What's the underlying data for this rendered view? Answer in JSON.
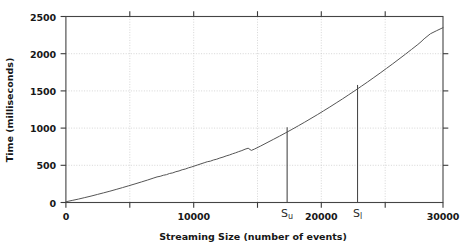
{
  "chart_data": {
    "type": "line",
    "title": "",
    "xlabel": "Streaming Size (number of events)",
    "ylabel": "Time (milliseconds)",
    "xlim": [
      0,
      30000
    ],
    "ylim": [
      0,
      2500
    ],
    "xticks": [
      0,
      10000,
      20000,
      30000
    ],
    "xtick_labels": [
      "0",
      "10000",
      "20000",
      "30000"
    ],
    "xminor_ticks": [
      5000,
      15000,
      25000
    ],
    "yticks": [
      0,
      500,
      1000,
      1500,
      2000,
      2500
    ],
    "ytick_labels": [
      "0",
      "500",
      "1000",
      "1500",
      "2000",
      "2500"
    ],
    "grid": true,
    "grid_style": "dotted",
    "grid_x": [
      5000,
      10000,
      15000,
      20000,
      25000
    ],
    "grid_y": [
      500,
      1000,
      1500,
      2000
    ],
    "legend": null,
    "series": [
      {
        "name": "streaming time",
        "color": "#555555",
        "x": [
          0,
          500,
          1000,
          1500,
          2000,
          2500,
          3000,
          3500,
          4000,
          4500,
          5000,
          5500,
          6000,
          6500,
          7000,
          7250,
          7500,
          7750,
          8000,
          8250,
          8500,
          8750,
          9000,
          9250,
          9500,
          9750,
          10000,
          10500,
          11000,
          11250,
          11500,
          11750,
          12000,
          12250,
          12500,
          12750,
          13000,
          13250,
          13500,
          13750,
          14000,
          14250,
          14500,
          14750,
          15000,
          15500,
          16000,
          16500,
          17000,
          17500,
          18000,
          18500,
          19000,
          19500,
          20000,
          20500,
          21000,
          21500,
          22000,
          22500,
          23000,
          23500,
          24000,
          24500,
          25000,
          25500,
          26000,
          26500,
          27000,
          27500,
          28000,
          28250,
          28500,
          29000,
          29500,
          30000
        ],
        "y": [
          10,
          28,
          46,
          66,
          86,
          108,
          130,
          152,
          176,
          200,
          225,
          250,
          276,
          302,
          330,
          344,
          352,
          366,
          374,
          390,
          398,
          414,
          424,
          440,
          450,
          466,
          478,
          506,
          534,
          548,
          556,
          572,
          582,
          598,
          610,
          626,
          638,
          654,
          668,
          684,
          698,
          716,
          730,
          700,
          718,
          760,
          804,
          848,
          892,
          938,
          984,
          1032,
          1080,
          1130,
          1180,
          1232,
          1284,
          1338,
          1392,
          1448,
          1504,
          1562,
          1620,
          1680,
          1740,
          1802,
          1864,
          1928,
          1992,
          2058,
          2124,
          2160,
          2200,
          2268,
          2310,
          2350
        ]
      }
    ],
    "annotations": [
      {
        "name": "S_u",
        "label": "S",
        "subscript": "u",
        "x": 17600,
        "y_top": 1010,
        "type": "vertical-marker"
      },
      {
        "name": "S_l",
        "label": "S",
        "subscript": "l",
        "x": 23200,
        "y_top": 1580,
        "type": "vertical-marker"
      }
    ]
  },
  "colors": {
    "line": "#555555",
    "axis": "#2b2b2b",
    "grid": "#bfbfbf",
    "marker": "#4a4a4a",
    "background": "#ffffff"
  }
}
